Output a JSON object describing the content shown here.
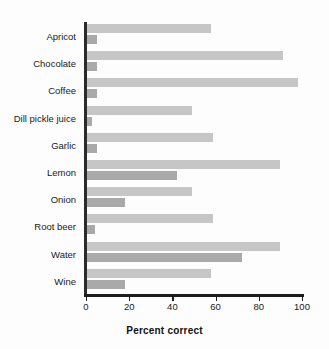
{
  "chart_data": {
    "type": "bar",
    "orientation": "horizontal",
    "title": "",
    "xlabel": "Percent correct",
    "ylabel": "",
    "xlim": [
      0,
      100
    ],
    "xticks": [
      0,
      20,
      40,
      60,
      80,
      100
    ],
    "grid": false,
    "legend": "none",
    "categories": [
      "Apricot",
      "Chocolate",
      "Coffee",
      "Dill pickle juice",
      "Garlic",
      "Lemon",
      "Onion",
      "Root beer",
      "Water",
      "Wine"
    ],
    "series": [
      {
        "name": "upper",
        "color": "#c6c6c6",
        "values": [
          58,
          91,
          98,
          49,
          59,
          90,
          49,
          59,
          90,
          58
        ]
      },
      {
        "name": "lower",
        "color": "#a9a9a9",
        "values": [
          5,
          5,
          5,
          3,
          5,
          42,
          18,
          4,
          72,
          18
        ]
      }
    ]
  },
  "axis": {
    "tick_labels": [
      "0",
      "20",
      "40",
      "60",
      "80",
      "100"
    ],
    "x_title": "Percent correct",
    "axis_color": "#1d1d1d"
  },
  "colors": {
    "background": "#fdfdfd",
    "bar_light": "#c6c6c6",
    "bar_dark": "#a9a9a9",
    "text": "#1a1a1a"
  }
}
